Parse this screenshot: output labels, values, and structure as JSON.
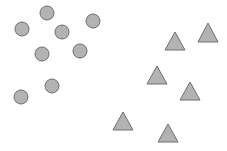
{
  "diagram": {
    "background": "#ffffff",
    "fill_color": "#b3b3b3",
    "stroke_color": "#6e6e6e",
    "circles": [
      {
        "cx": 47,
        "cy": 13,
        "r": 7
      },
      {
        "cx": 22,
        "cy": 29,
        "r": 7
      },
      {
        "cx": 62,
        "cy": 32,
        "r": 7
      },
      {
        "cx": 93,
        "cy": 21,
        "r": 7
      },
      {
        "cx": 42,
        "cy": 54,
        "r": 7
      },
      {
        "cx": 80,
        "cy": 51,
        "r": 7
      },
      {
        "cx": 52,
        "cy": 86,
        "r": 7
      },
      {
        "cx": 21,
        "cy": 97,
        "r": 7
      }
    ],
    "triangles": [
      {
        "cx": 175,
        "top": 32,
        "bottom": 50,
        "half_width": 10
      },
      {
        "cx": 208,
        "top": 23,
        "bottom": 42,
        "half_width": 10
      },
      {
        "cx": 157,
        "top": 66,
        "bottom": 84,
        "half_width": 10
      },
      {
        "cx": 190,
        "top": 82,
        "bottom": 100,
        "half_width": 10
      },
      {
        "cx": 123,
        "top": 112,
        "bottom": 130,
        "half_width": 10
      },
      {
        "cx": 168,
        "top": 124,
        "bottom": 142,
        "half_width": 10
      }
    ]
  }
}
